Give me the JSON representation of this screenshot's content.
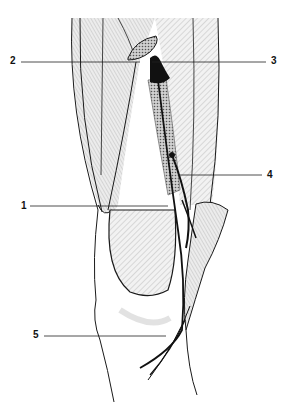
{
  "figure": {
    "type": "anatomical line drawing",
    "labels": [
      {
        "id": "1",
        "text": "1",
        "x": 21,
        "y": 201,
        "line": {
          "x1": 30,
          "y1": 206,
          "x2": 168,
          "y2": 206
        }
      },
      {
        "id": "2",
        "text": "2",
        "x": 10,
        "y": 56,
        "line": {
          "x1": 21,
          "y1": 62,
          "x2": 140,
          "y2": 62
        }
      },
      {
        "id": "3",
        "text": "3",
        "x": 271,
        "y": 56,
        "line": {
          "x1": 152,
          "y1": 62,
          "x2": 266,
          "y2": 62
        }
      },
      {
        "id": "4",
        "text": "4",
        "x": 267,
        "y": 170,
        "line": {
          "x1": 190,
          "y1": 175,
          "x2": 262,
          "y2": 175
        }
      },
      {
        "id": "5",
        "text": "5",
        "x": 33,
        "y": 330,
        "line": {
          "x1": 44,
          "y1": 336,
          "x2": 166,
          "y2": 336
        }
      }
    ],
    "colors": {
      "ink": "#1a1a1a",
      "shade": "#d9d9d9",
      "background": "#ffffff"
    }
  }
}
